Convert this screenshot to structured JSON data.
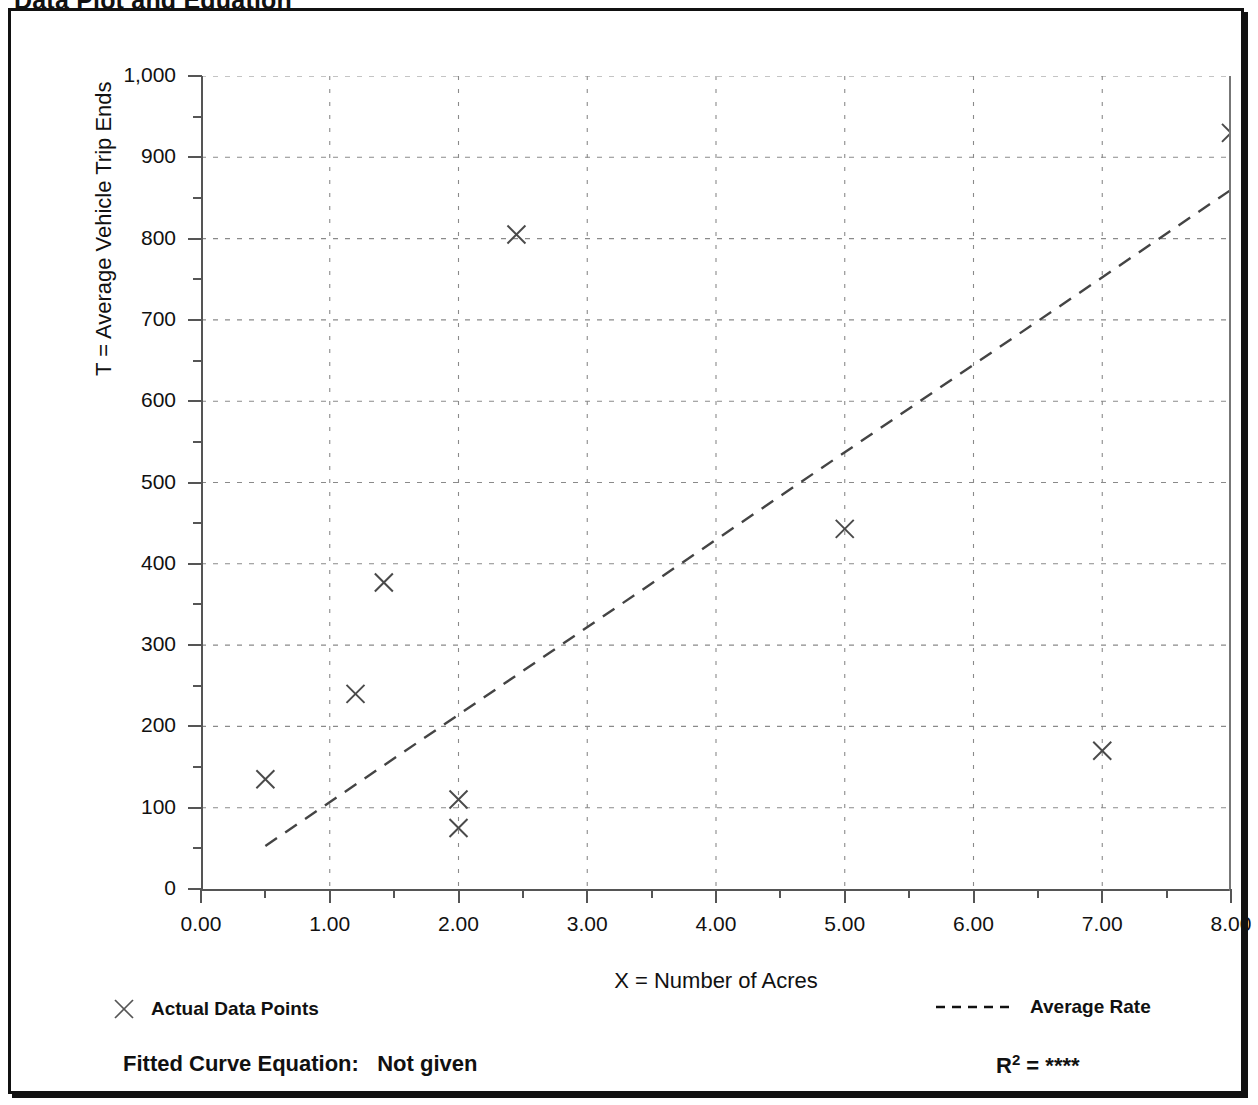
{
  "document": {
    "title": "Data Plot and Equation"
  },
  "chart_data": {
    "type": "scatter",
    "title": "Data Plot and Equation",
    "xlabel": "X = Number of Acres",
    "ylabel": "T = Average Vehicle Trip Ends",
    "xlim": [
      0,
      8
    ],
    "ylim": [
      0,
      1000
    ],
    "grid": true,
    "x_ticks": [
      "0.00",
      "1.00",
      "2.00",
      "3.00",
      "4.00",
      "5.00",
      "6.00",
      "7.00",
      "8.00"
    ],
    "x_tick_values": [
      0,
      1,
      2,
      3,
      4,
      5,
      6,
      7,
      8
    ],
    "x_minor_step": 0.5,
    "y_ticks": [
      "0",
      "100",
      "200",
      "300",
      "400",
      "500",
      "600",
      "700",
      "800",
      "900",
      "1,000"
    ],
    "y_tick_values": [
      0,
      100,
      200,
      300,
      400,
      500,
      600,
      700,
      800,
      900,
      1000
    ],
    "y_minor_step": 50,
    "series": [
      {
        "name": "Actual Data Points",
        "type": "scatter",
        "marker": "x",
        "points": [
          {
            "x": 0.5,
            "y": 135
          },
          {
            "x": 1.2,
            "y": 240
          },
          {
            "x": 1.42,
            "y": 377
          },
          {
            "x": 2.0,
            "y": 110
          },
          {
            "x": 2.0,
            "y": 75
          },
          {
            "x": 2.45,
            "y": 805
          },
          {
            "x": 5.0,
            "y": 443
          },
          {
            "x": 7.0,
            "y": 170
          },
          {
            "x": 8.0,
            "y": 930
          }
        ]
      },
      {
        "name": "Average Rate",
        "type": "line",
        "style": "dashed",
        "points": [
          {
            "x": 0.5,
            "y": 53
          },
          {
            "x": 8.0,
            "y": 860
          }
        ]
      }
    ],
    "legend": [
      {
        "label": "Actual Data Points",
        "marker": "x"
      },
      {
        "label": "Average Rate",
        "marker": "dashed-line"
      }
    ],
    "annotations": {
      "equation_label": "Fitted Curve Equation:",
      "equation_value": "Not given",
      "r2_label": "R",
      "r2_exponent": "2",
      "r2_equals": "=",
      "r2_value": "****"
    }
  }
}
